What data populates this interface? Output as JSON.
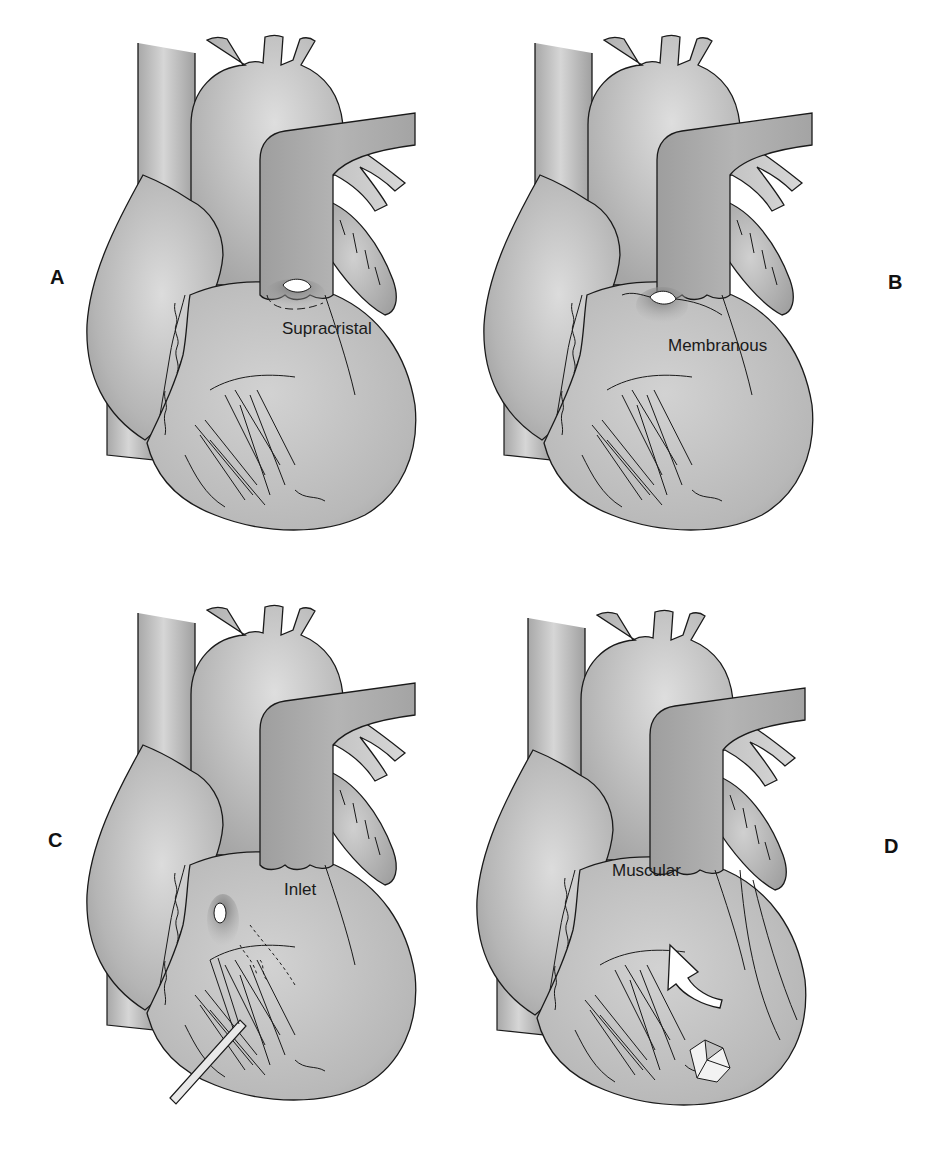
{
  "figure": {
    "colors": {
      "tissue_fill": "#bdbdbd",
      "tissue_light": "#d9d9d9",
      "tissue_dark": "#9a9a9a",
      "outline": "#1a1a1a",
      "defect_hole": "#ffffff",
      "background": "#ffffff"
    },
    "panels": [
      {
        "id": "A",
        "letter": "A",
        "label": "Supracristal",
        "defect": "supracristal ventricular septal defect below pulmonary valve"
      },
      {
        "id": "B",
        "letter": "B",
        "label": "Membranous",
        "defect": "membranous ventricular septal defect"
      },
      {
        "id": "C",
        "letter": "C",
        "label": "Inlet",
        "defect": "inlet ventricular septal defect with probe passing through"
      },
      {
        "id": "D",
        "letter": "D",
        "label": "Muscular",
        "defect": "muscular ventricular septal defect with arrow through trabeculations"
      }
    ]
  }
}
